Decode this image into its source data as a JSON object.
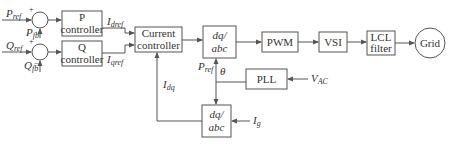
{
  "diagram": {
    "blocks": {
      "p_controller": [
        "P",
        "controller"
      ],
      "q_controller": [
        "Q",
        "controller"
      ],
      "current_controller": [
        "Current",
        "controller"
      ],
      "dq_abc_top": [
        "dq/",
        "abc"
      ],
      "pwm": "PWM",
      "vsi": "VSI",
      "lcl_filter": [
        "LCL",
        "filter"
      ],
      "grid": "Grid",
      "pll": "PLL",
      "dq_abc_bottom": [
        "dq/",
        "abc"
      ]
    },
    "signals": {
      "p_ref": {
        "main": "P",
        "sub": "ref"
      },
      "p_fb": {
        "main": "P",
        "sub": "fb"
      },
      "q_ref": {
        "main": "Q",
        "sub": "ref"
      },
      "q_fb": {
        "main": "Q",
        "sub": "fb"
      },
      "i_dref": {
        "main": "I",
        "sub": "dref"
      },
      "i_qref": {
        "main": "I",
        "sub": "qref"
      },
      "i_dq": {
        "main": "I",
        "sub": "dq"
      },
      "p_ref_2": {
        "main": "P",
        "sub": "ref"
      },
      "theta": "θ",
      "v_ac": {
        "main": "V",
        "sub": "AC"
      },
      "i_g": {
        "main": "I",
        "sub": "g"
      }
    },
    "signs": {
      "plus": "+",
      "minus": "−"
    }
  }
}
